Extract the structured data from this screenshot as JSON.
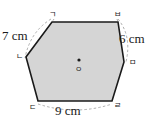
{
  "figure": {
    "type": "hexagon",
    "shape_name": "hexagon-diagram",
    "fill_color": "#d5d5d5",
    "stroke_color": "#1a1a1a",
    "background_color": "#ffffff",
    "dash_color": "#8a8a8a"
  },
  "measurements": {
    "left_side": "7 cm",
    "right_side": "6 cm",
    "bottom_side": "9 cm"
  },
  "vertices": {
    "top_left": "ㄱ",
    "top_right": "ㅂ",
    "middle_left": "ㄴ",
    "middle_right": "ㅁ",
    "bottom_left": "ㄷ",
    "bottom_right": "ㄹ"
  },
  "center": {
    "label": "ㅇ"
  }
}
